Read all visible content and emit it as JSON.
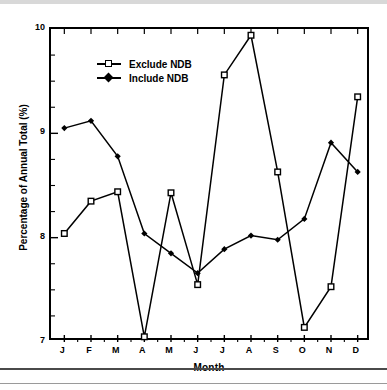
{
  "chart_data": {
    "type": "line",
    "title": "",
    "xlabel": "Month",
    "ylabel": "Percentage of Annual Total (%)",
    "categories": [
      "J",
      "F",
      "M",
      "A",
      "M",
      "J",
      "J",
      "A",
      "S",
      "O",
      "N",
      "D"
    ],
    "ylim": [
      7,
      10
    ],
    "yticks": [
      7,
      8,
      9,
      10
    ],
    "ytick_labels": [
      "7",
      "8",
      "9",
      "10"
    ],
    "yminor_step": 0.25,
    "xlim_pad": 0.5,
    "grid": false,
    "legend_position": "upper-left-inside",
    "series": [
      {
        "name": "Exclude NDB",
        "marker": "open-square",
        "color": "#000000",
        "values": [
          8.04,
          8.35,
          8.44,
          7.05,
          8.43,
          7.55,
          9.56,
          9.94,
          8.63,
          7.14,
          7.53,
          9.35
        ]
      },
      {
        "name": "Include NDB",
        "marker": "filled-diamond",
        "color": "#000000",
        "values": [
          9.05,
          9.12,
          8.78,
          8.04,
          7.85,
          7.66,
          7.89,
          8.02,
          7.98,
          8.18,
          8.91,
          8.63
        ]
      }
    ]
  },
  "legend": {
    "items": [
      {
        "label": "Exclude NDB",
        "marker": "open-square"
      },
      {
        "label": "Include NDB",
        "marker": "filled-diamond"
      }
    ]
  },
  "axes": {
    "x_title": "Month",
    "y_title": "Percentage of Annual Total (%)"
  }
}
